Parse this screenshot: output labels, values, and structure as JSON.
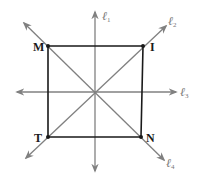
{
  "diagram": {
    "colors": {
      "square": "#1a1a1a",
      "lines": "#808080",
      "labels": "#777777"
    },
    "vertices": [
      {
        "id": "M",
        "label": "M",
        "x": 48,
        "y": 46,
        "label_x": 33,
        "label_y": 51
      },
      {
        "id": "I",
        "label": "I",
        "x": 143,
        "y": 46,
        "label_x": 150,
        "label_y": 51
      },
      {
        "id": "N",
        "label": "N",
        "x": 141,
        "y": 137,
        "label_x": 146,
        "label_y": 142
      },
      {
        "id": "T",
        "label": "T",
        "x": 48,
        "y": 137,
        "label_x": 34,
        "label_y": 142
      }
    ],
    "lines": [
      {
        "id": "l1",
        "label": "ℓ",
        "subscript": "1",
        "orientation": "vertical",
        "x1": 95,
        "y1": 171,
        "x2": 95,
        "y2": 12,
        "label_x": 102,
        "label_y": 20
      },
      {
        "id": "l2",
        "label": "ℓ",
        "subscript": "2",
        "orientation": "diagonal-up",
        "x1": 26,
        "y1": 158,
        "x2": 166,
        "y2": 26,
        "label_x": 168,
        "label_y": 25
      },
      {
        "id": "l3",
        "label": "ℓ",
        "subscript": "3",
        "orientation": "horizontal",
        "x1": 17,
        "y1": 92,
        "x2": 176,
        "y2": 92,
        "label_x": 180,
        "label_y": 96
      },
      {
        "id": "l4",
        "label": "ℓ",
        "subscript": "4",
        "orientation": "diagonal-down",
        "x1": 24,
        "y1": 23,
        "x2": 164,
        "y2": 160,
        "label_x": 166,
        "label_y": 167
      }
    ]
  }
}
